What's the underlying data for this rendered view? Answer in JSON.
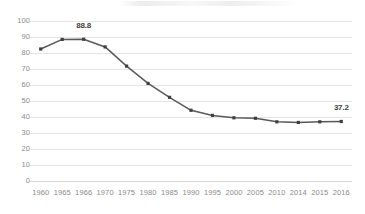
{
  "chart_data": {
    "type": "line",
    "title": "",
    "subtitle": "",
    "xlabel": "",
    "ylabel": "",
    "categories": [
      "1960",
      "1965",
      "1966",
      "1970",
      "1975",
      "1980",
      "1985",
      "1990",
      "1995",
      "2000",
      "2005",
      "2010",
      "2014",
      "2015",
      "2016"
    ],
    "values": [
      82.5,
      88.5,
      88.6,
      83.8,
      71.8,
      61.0,
      52.3,
      44.2,
      41.0,
      39.5,
      39.2,
      37.0,
      36.6,
      37.0,
      37.2
    ],
    "series": [
      {
        "name": "series-1",
        "values": [
          82.5,
          88.5,
          88.6,
          83.8,
          71.8,
          61.0,
          52.3,
          44.2,
          41.0,
          39.5,
          39.2,
          37.0,
          36.6,
          37.0,
          37.2
        ]
      }
    ],
    "ylim": [
      0,
      100
    ],
    "y_ticks": [
      0,
      10,
      20,
      30,
      40,
      50,
      60,
      70,
      80,
      90,
      100
    ],
    "y_tick_labels": [
      "0",
      "10",
      "20",
      "30",
      "40",
      "50",
      "60",
      "70",
      "80",
      "90",
      "100"
    ],
    "grid": true,
    "grid_axis": "y",
    "legend": false,
    "legend_position": "none",
    "markers": true,
    "annotations": [
      {
        "category": "1966",
        "value": 88.8,
        "text": "88.8",
        "position": "above"
      },
      {
        "category": "2016",
        "value": 37.2,
        "text": "37.2",
        "position": "above"
      }
    ],
    "colors": {
      "line": "#595959",
      "marker": "#404040",
      "gridline": "#e4e4e4",
      "tick_label": "#8a8a8a",
      "data_label": "#3f3f3f",
      "background": "#ffffff"
    }
  }
}
